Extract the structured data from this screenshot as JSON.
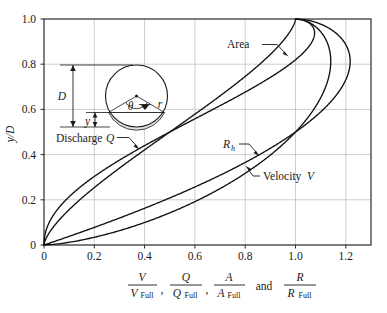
{
  "figure": {
    "name": "hydraulic-elements-circular-pipe-chart",
    "background_color": "#ffffff",
    "curve_color": "#111111",
    "grid_color": "#b9b9b9",
    "frame_color": "#2b2b2b"
  },
  "axes": {
    "y_title": "y/D",
    "y_title_numerator": "y",
    "y_title_denominator": "D",
    "x_ticks": [
      "0",
      "0.2",
      "0.4",
      "0.6",
      "0.8",
      "1.0",
      "1.2"
    ],
    "y_ticks": [
      "0",
      "0.2",
      "0.4",
      "0.6",
      "0.8",
      "1.0"
    ],
    "x_label_parts": {
      "t1_num": "V",
      "t1_den": "V",
      "t1_den_sub": "Full",
      "comma1": ",",
      "t2_num": "Q",
      "t2_den": "Q",
      "t2_den_sub": "Full",
      "comma2": ",",
      "t3_num": "A",
      "t3_den": "A",
      "t3_den_sub": "Full",
      "conj": "and",
      "t4_num": "R",
      "t4_den": "R",
      "t4_den_sub": "Full"
    }
  },
  "curve_labels": {
    "area": "Area",
    "discharge_text": "Discharge",
    "discharge_sym": "Q",
    "rh_sym": "R",
    "rh_sub": "h",
    "velocity_text": "Velocity",
    "velocity_sym": "V"
  },
  "inset": {
    "name": "pipe-cross-section-diagram",
    "diameter_label": "D",
    "depth_label": "y",
    "angle_label": "θ",
    "radius_label": "r"
  },
  "chart_data": {
    "type": "line",
    "title": "",
    "xlabel": "V/V_Full , Q/Q_Full , A/A_Full and R/R_Full",
    "ylabel": "y/D",
    "xlim": [
      0,
      1.3
    ],
    "ylim": [
      0,
      1.0
    ],
    "xticks": [
      0,
      0.2,
      0.4,
      0.6,
      0.8,
      1.0,
      1.2
    ],
    "yticks": [
      0,
      0.2,
      0.4,
      0.6,
      0.8,
      1.0
    ],
    "grid": true,
    "legend": "inline-annotations",
    "y_over_D": [
      0.0,
      0.05,
      0.1,
      0.15,
      0.2,
      0.25,
      0.3,
      0.35,
      0.4,
      0.45,
      0.5,
      0.55,
      0.6,
      0.65,
      0.7,
      0.75,
      0.8,
      0.85,
      0.9,
      0.93,
      0.95,
      0.97,
      0.99,
      1.0
    ],
    "series": [
      {
        "name": "Area",
        "label": "Area",
        "ratio": "A/A_Full",
        "values": [
          0.0,
          0.019,
          0.052,
          0.094,
          0.142,
          0.196,
          0.252,
          0.312,
          0.374,
          0.437,
          0.5,
          0.563,
          0.626,
          0.688,
          0.748,
          0.804,
          0.858,
          0.906,
          0.948,
          0.968,
          0.981,
          0.991,
          0.998,
          1.0
        ],
        "max_value": 1.0,
        "max_at_y_over_D": 1.0
      },
      {
        "name": "Discharge Q",
        "label": "Discharge Q",
        "ratio": "Q/Q_Full",
        "values": [
          0.0,
          0.005,
          0.021,
          0.049,
          0.088,
          0.137,
          0.196,
          0.263,
          0.337,
          0.415,
          0.5,
          0.586,
          0.672,
          0.756,
          0.838,
          0.912,
          0.977,
          1.032,
          1.066,
          1.072,
          1.071,
          1.062,
          1.035,
          1.0
        ],
        "max_value": 1.076,
        "max_at_y_over_D": 0.94
      },
      {
        "name": "R_h",
        "label": "R_h",
        "ratio": "R/R_Full",
        "values": [
          0.0,
          0.132,
          0.254,
          0.364,
          0.464,
          0.555,
          0.638,
          0.714,
          0.783,
          0.846,
          0.904,
          0.956,
          1.003,
          1.046,
          1.084,
          1.117,
          1.146,
          1.17,
          1.188,
          1.194,
          1.196,
          1.196,
          1.195,
          1.0
        ],
        "max_value": 1.2167,
        "max_at_y_over_D": 0.81
      },
      {
        "name": "Velocity V",
        "label": "Velocity V",
        "ratio": "V/V_Full",
        "values": [
          0.0,
          0.257,
          0.401,
          0.517,
          0.615,
          0.701,
          0.777,
          0.845,
          0.906,
          0.96,
          1.0,
          1.039,
          1.073,
          1.103,
          1.129,
          1.15,
          1.167,
          1.18,
          1.188,
          1.189,
          1.189,
          1.188,
          1.186,
          1.0
        ],
        "max_value": 1.14,
        "max_at_y_over_D": 0.82
      }
    ],
    "annotations": [
      {
        "text": "Area",
        "points_to_series": "Area"
      },
      {
        "text": "Discharge Q",
        "points_to_series": "Discharge Q"
      },
      {
        "text": "R_h",
        "points_to_series": "R_h"
      },
      {
        "text": "Velocity V",
        "points_to_series": "Velocity V"
      }
    ]
  }
}
